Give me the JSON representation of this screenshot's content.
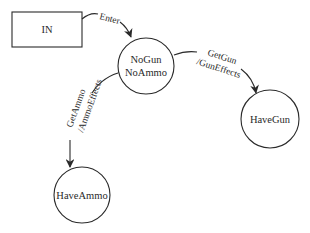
{
  "diagram": {
    "type": "state-machine",
    "colors": {
      "stroke": "#2a2a2a",
      "background": "#ffffff",
      "text": "#2a2a2a"
    },
    "nodes": {
      "in": {
        "label": "IN",
        "shape": "rectangle"
      },
      "nogun": {
        "line1": "NoGun",
        "line2": "NoAmmo",
        "shape": "circle"
      },
      "havegun": {
        "label": "HaveGun",
        "shape": "circle"
      },
      "haveammo": {
        "label": "HaveAmmo",
        "shape": "circle"
      }
    },
    "edges": {
      "enter": {
        "from": "IN",
        "to": "NoGun NoAmmo",
        "label": "Enter"
      },
      "getgun": {
        "from": "NoGun NoAmmo",
        "to": "HaveGun",
        "line1": "GetGun",
        "line2": "/GunEffects"
      },
      "getammo": {
        "from": "NoGun NoAmmo",
        "to": "HaveAmmo",
        "line1": "GetAmmo",
        "line2": "/AmmoEffects"
      }
    }
  }
}
